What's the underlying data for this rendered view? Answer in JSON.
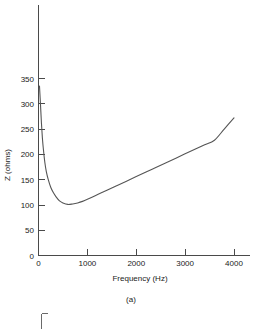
{
  "figure": {
    "caption": "(a)"
  },
  "chart_data": {
    "type": "line",
    "title": "",
    "xlabel": "Frequency (Hz)",
    "ylabel": "Z (ohms)",
    "xlim": [
      0,
      4300
    ],
    "ylim": [
      0,
      395
    ],
    "grid": false,
    "legend": "none",
    "xticks": [
      0,
      1000,
      2000,
      3000,
      4000
    ],
    "xtick_labels": [
      "0",
      "1000",
      "2000",
      "3000",
      "4000"
    ],
    "yticks": [
      0,
      50,
      100,
      150,
      200,
      250,
      300,
      350
    ],
    "ytick_labels": [
      "0",
      "50",
      "100",
      "150",
      "200",
      "250",
      "300",
      "350"
    ],
    "series": [
      {
        "name": "Impedance magnitude",
        "x": [
          20,
          40,
          60,
          80,
          100,
          130,
          160,
          200,
          250,
          300,
          360,
          430,
          500,
          600,
          700,
          800,
          900,
          1000,
          1200,
          1400,
          1600,
          1800,
          2000,
          2200,
          2400,
          2600,
          2800,
          3000,
          3200,
          3400,
          3600,
          3800,
          4000
        ],
        "y": [
          335,
          300,
          262,
          232,
          210,
          184,
          166,
          150,
          135,
          125,
          116,
          108,
          104,
          101,
          102,
          104,
          107,
          111,
          120,
          129,
          138,
          147,
          156,
          165,
          174,
          183,
          192,
          201,
          210,
          219,
          228,
          250,
          272
        ]
      }
    ],
    "annotations": {
      "minimum_value_ohms": 101,
      "minimum_frequency_hz": 600,
      "max_left_value_ohms": 335,
      "end_value_ohms": 272
    },
    "colors": {
      "curve": "#555555",
      "axis": "#4a4a4a",
      "background": "#ffffff",
      "text": "#1a1a1a"
    }
  }
}
